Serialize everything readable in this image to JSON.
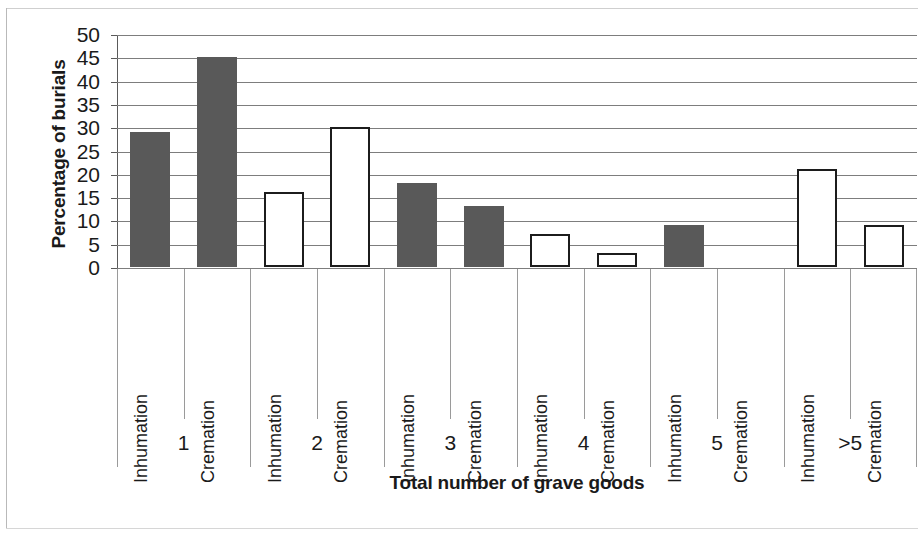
{
  "chart_data": {
    "type": "bar",
    "title": "",
    "xlabel": "Total number of grave goods",
    "ylabel": "Percentage of burials",
    "ylim": [
      0,
      50
    ],
    "yticks": [
      0,
      5,
      10,
      15,
      20,
      25,
      30,
      35,
      40,
      45,
      50
    ],
    "ytick_labels": [
      "0",
      "5",
      "10",
      "15",
      "20",
      "25",
      "30",
      "35",
      "40",
      "45",
      "50"
    ],
    "grid": true,
    "legend": "none",
    "categories": [
      "1",
      "2",
      "3",
      "4",
      "5",
      ">5"
    ],
    "subcategories": [
      "Inhumation",
      "Cremation"
    ],
    "series": [
      {
        "name": "Inhumation",
        "values": [
          29,
          16,
          18,
          7,
          9,
          21
        ]
      },
      {
        "name": "Cremation",
        "values": [
          45,
          30,
          13,
          3,
          0,
          9
        ]
      }
    ],
    "bars": [
      {
        "group": "1",
        "subcategory": "Inhumation",
        "value": 29,
        "style": "filled"
      },
      {
        "group": "1",
        "subcategory": "Cremation",
        "value": 45,
        "style": "filled"
      },
      {
        "group": "2",
        "subcategory": "Inhumation",
        "value": 16,
        "style": "hollow"
      },
      {
        "group": "2",
        "subcategory": "Cremation",
        "value": 30,
        "style": "hollow"
      },
      {
        "group": "3",
        "subcategory": "Inhumation",
        "value": 18,
        "style": "filled"
      },
      {
        "group": "3",
        "subcategory": "Cremation",
        "value": 13,
        "style": "filled"
      },
      {
        "group": "4",
        "subcategory": "Inhumation",
        "value": 7,
        "style": "hollow"
      },
      {
        "group": "4",
        "subcategory": "Cremation",
        "value": 3,
        "style": "hollow"
      },
      {
        "group": "5",
        "subcategory": "Inhumation",
        "value": 9,
        "style": "filled"
      },
      {
        "group": "5",
        "subcategory": "Cremation",
        "value": 0,
        "style": "filled"
      },
      {
        "group": ">5",
        "subcategory": "Inhumation",
        "value": 21,
        "style": "hollow"
      },
      {
        "group": ">5",
        "subcategory": "Cremation",
        "value": 9,
        "style": "hollow"
      }
    ],
    "colors": {
      "bar_filled": "#595959",
      "bar_hollow_fill": "#ffffff",
      "bar_outline": "#1c1c1c",
      "gridline": "#7d7d7d",
      "axis": "#4a4a4a",
      "text": "#1a1a1a",
      "background": "#ffffff"
    }
  }
}
